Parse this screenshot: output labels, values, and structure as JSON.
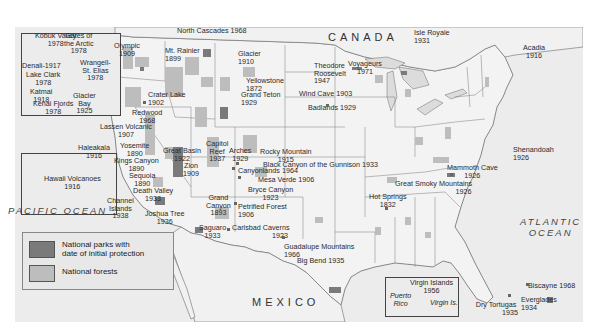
{
  "map": {
    "title": "United States National Parks and Forests",
    "regions": {
      "canada": "CANADA",
      "mexico": "MEXICO",
      "pacific_ocean": "PACIFIC OCEAN",
      "atlantic_ocean_line1": "ATLANTIC",
      "atlantic_ocean_line2": "OCEAN"
    },
    "legend": {
      "items": [
        {
          "label_line1": "National parks with",
          "label_line2": "date of initial protection",
          "color": "#7a7a7a"
        },
        {
          "label_line1": "National forests",
          "label_line2": "",
          "color": "#bdbdbd"
        }
      ]
    },
    "colors": {
      "land": "#f3f3f3",
      "water": "#e6e6e6",
      "park": "#7a7a7a",
      "forest": "#bdbdbd",
      "border": "#6b6b6b"
    },
    "alaska_inset": {
      "parks": [
        {
          "name": "Kobuk Valley",
          "year": "1978"
        },
        {
          "name": "Gates of the Arctic",
          "year": "1978"
        },
        {
          "name": "Denali",
          "year": "1917"
        },
        {
          "name": "Wrangell-St. Elias",
          "year": "1978"
        },
        {
          "name": "Lake Clark",
          "year": "1978"
        },
        {
          "name": "Katmai",
          "year": "1918"
        },
        {
          "name": "Glacier Bay",
          "year": "1925"
        },
        {
          "name": "Kenai Fjords",
          "year": "1978"
        }
      ]
    },
    "hawaii_inset": {
      "parks": [
        {
          "name": "Haleakala",
          "year": "1916"
        },
        {
          "name": "Hawaii Volcanoes",
          "year": "1916"
        }
      ]
    },
    "caribbean_inset": {
      "labels": {
        "puerto_rico_1": "Puerto",
        "puerto_rico_2": "Rico",
        "virgin_is": "Virgin Is."
      },
      "parks": [
        {
          "name": "Virgin Islands",
          "year": "1956"
        }
      ]
    },
    "parks": [
      {
        "name": "North Cascades",
        "year": "1968"
      },
      {
        "name": "Olympic",
        "year": "1909"
      },
      {
        "name": "Mt. Rainier",
        "year": "1899"
      },
      {
        "name": "Glacier",
        "year": "1910"
      },
      {
        "name": "Crater Lake",
        "year": "1902"
      },
      {
        "name": "Redwood",
        "year": "1968"
      },
      {
        "name": "Lassen Volcanic",
        "year": "1907"
      },
      {
        "name": "Yosemite",
        "year": "1890"
      },
      {
        "name": "Kings Canyon",
        "year": "1890"
      },
      {
        "name": "Sequoia",
        "year": "1890"
      },
      {
        "name": "Death Valley",
        "year": "1933"
      },
      {
        "name": "Channel Islands",
        "year": "1938"
      },
      {
        "name": "Joshua Tree",
        "year": "1936"
      },
      {
        "name": "Great Basin",
        "year": "1922"
      },
      {
        "name": "Zion",
        "year": "1909"
      },
      {
        "name": "Capitol Reef",
        "year": "1937"
      },
      {
        "name": "Arches",
        "year": "1929"
      },
      {
        "name": "Canyonlands",
        "year": "1964"
      },
      {
        "name": "Bryce Canyon",
        "year": "1923"
      },
      {
        "name": "Grand Canyon",
        "year": "1893"
      },
      {
        "name": "Petrified Forest",
        "year": "1906"
      },
      {
        "name": "Saguaro",
        "year": "1933"
      },
      {
        "name": "Carlsbad Caverns",
        "year": "1923"
      },
      {
        "name": "Guadalupe Mountains",
        "year": "1966"
      },
      {
        "name": "Big Bend",
        "year": "1935"
      },
      {
        "name": "Yellowstone",
        "year": "1872"
      },
      {
        "name": "Grand Teton",
        "year": "1929"
      },
      {
        "name": "Rocky Mountain",
        "year": "1915"
      },
      {
        "name": "Black Canyon of the Gunnison",
        "year": "1933"
      },
      {
        "name": "Mesa Verde",
        "year": "1906"
      },
      {
        "name": "Theodore Roosevelt",
        "year": "1947"
      },
      {
        "name": "Wind Cave",
        "year": "1903"
      },
      {
        "name": "Badlands",
        "year": "1929"
      },
      {
        "name": "Voyageurs",
        "year": "1971"
      },
      {
        "name": "Isle Royale",
        "year": "1931"
      },
      {
        "name": "Acadia",
        "year": "1916"
      },
      {
        "name": "Shenandoah",
        "year": "1926"
      },
      {
        "name": "Mammoth Cave",
        "year": "1926"
      },
      {
        "name": "Great Smoky Mountains",
        "year": "1926"
      },
      {
        "name": "Hot Springs",
        "year": "1832"
      },
      {
        "name": "Biscayne",
        "year": "1968"
      },
      {
        "name": "Everglades",
        "year": "1934"
      },
      {
        "name": "Dry Tortugas",
        "year": "1935"
      }
    ]
  }
}
